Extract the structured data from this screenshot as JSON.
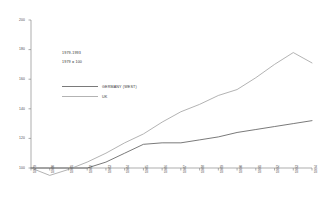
{
  "annotations": {
    "period": "1979-1993",
    "base": "1979 = 100"
  },
  "legend": {
    "position": "inside-upper-left",
    "entries": [
      {
        "label": "GERMANY (WEST)",
        "color": "#4d4d4d",
        "style": "solid-thick"
      },
      {
        "label": "UK",
        "color": "#9a9a9a",
        "style": "solid-thin"
      }
    ]
  },
  "chart_data": {
    "type": "line",
    "title": "",
    "subtitle": "",
    "xlabel": "",
    "ylabel": "",
    "grid": false,
    "ylim": [
      100,
      200
    ],
    "yticks": [
      100,
      120,
      140,
      160,
      180,
      200
    ],
    "ytick_labels": [
      "100",
      "120",
      "140",
      "160",
      "180",
      "200"
    ],
    "categories": [
      "1979",
      "1980",
      "1981",
      "1982",
      "1983",
      "1984",
      "1985",
      "1986",
      "1987",
      "1988",
      "1989",
      "1990",
      "1991",
      "1992",
      "1993",
      "1994"
    ],
    "x": [
      1979,
      1980,
      1981,
      1982,
      1983,
      1984,
      1985,
      1986,
      1987,
      1988,
      1989,
      1990,
      1991,
      1992,
      1993,
      1994
    ],
    "series": [
      {
        "name": "GERMANY (WEST)",
        "color": "#4d4d4d",
        "values": [
          100,
          100,
          100,
          100,
          104,
          110,
          116,
          117,
          117,
          119,
          121,
          124,
          126,
          128,
          130,
          132
        ]
      },
      {
        "name": "UK",
        "color": "#9a9a9a",
        "values": [
          100,
          95,
          99,
          104,
          110,
          117,
          123,
          131,
          138,
          143,
          149,
          153,
          161,
          170,
          178,
          171
        ]
      }
    ]
  }
}
